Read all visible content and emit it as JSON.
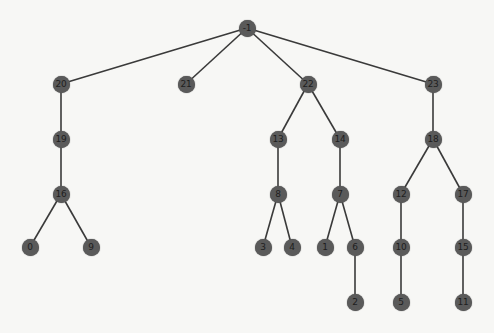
{
  "diagram": {
    "type": "tree",
    "style": {
      "node_color": "#5a5a5a",
      "label_color": "#1e1e1e",
      "edge_color": "#3a3a3a",
      "background": "#f7f7f5"
    },
    "nodes": [
      {
        "id": "-1",
        "label": "-1",
        "x": 247,
        "y": 28
      },
      {
        "id": "20",
        "label": "20",
        "x": 61,
        "y": 84
      },
      {
        "id": "21",
        "label": "21",
        "x": 186,
        "y": 84
      },
      {
        "id": "22",
        "label": "22",
        "x": 308,
        "y": 84
      },
      {
        "id": "23",
        "label": "23",
        "x": 433,
        "y": 84
      },
      {
        "id": "19",
        "label": "19",
        "x": 61,
        "y": 139
      },
      {
        "id": "13",
        "label": "13",
        "x": 278,
        "y": 139
      },
      {
        "id": "14",
        "label": "14",
        "x": 340,
        "y": 139
      },
      {
        "id": "18",
        "label": "18",
        "x": 433,
        "y": 139
      },
      {
        "id": "16",
        "label": "16",
        "x": 61,
        "y": 194
      },
      {
        "id": "8",
        "label": "8",
        "x": 278,
        "y": 194
      },
      {
        "id": "7",
        "label": "7",
        "x": 340,
        "y": 194
      },
      {
        "id": "12",
        "label": "12",
        "x": 401,
        "y": 194
      },
      {
        "id": "17",
        "label": "17",
        "x": 463,
        "y": 194
      },
      {
        "id": "0",
        "label": "0",
        "x": 30,
        "y": 247
      },
      {
        "id": "9",
        "label": "9",
        "x": 91,
        "y": 247
      },
      {
        "id": "3",
        "label": "3",
        "x": 263,
        "y": 247
      },
      {
        "id": "4",
        "label": "4",
        "x": 292,
        "y": 247
      },
      {
        "id": "1",
        "label": "1",
        "x": 325,
        "y": 247
      },
      {
        "id": "6",
        "label": "6",
        "x": 355,
        "y": 247
      },
      {
        "id": "10",
        "label": "10",
        "x": 401,
        "y": 247
      },
      {
        "id": "15",
        "label": "15",
        "x": 463,
        "y": 247
      },
      {
        "id": "2",
        "label": "2",
        "x": 355,
        "y": 302
      },
      {
        "id": "5",
        "label": "5",
        "x": 401,
        "y": 302
      },
      {
        "id": "11",
        "label": "11",
        "x": 463,
        "y": 302
      }
    ],
    "edges": [
      [
        "-1",
        "20"
      ],
      [
        "-1",
        "21"
      ],
      [
        "-1",
        "22"
      ],
      [
        "-1",
        "23"
      ],
      [
        "20",
        "19"
      ],
      [
        "19",
        "16"
      ],
      [
        "16",
        "0"
      ],
      [
        "16",
        "9"
      ],
      [
        "22",
        "13"
      ],
      [
        "22",
        "14"
      ],
      [
        "13",
        "8"
      ],
      [
        "8",
        "3"
      ],
      [
        "8",
        "4"
      ],
      [
        "14",
        "7"
      ],
      [
        "7",
        "1"
      ],
      [
        "7",
        "6"
      ],
      [
        "6",
        "2"
      ],
      [
        "23",
        "18"
      ],
      [
        "18",
        "12"
      ],
      [
        "18",
        "17"
      ],
      [
        "12",
        "10"
      ],
      [
        "10",
        "5"
      ],
      [
        "17",
        "15"
      ],
      [
        "15",
        "11"
      ]
    ]
  }
}
